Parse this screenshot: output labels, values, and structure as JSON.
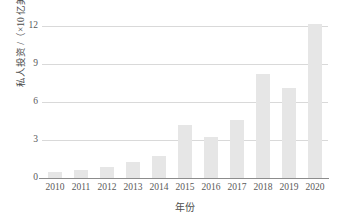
{
  "chart_data": {
    "type": "bar",
    "title": "",
    "subtitle": "",
    "xlabel": "年份",
    "ylabel": "私人投资 /（×10 亿美元）",
    "categories": [
      "2010",
      "2011",
      "2012",
      "2013",
      "2014",
      "2015",
      "2016",
      "2017",
      "2018",
      "2019",
      "2020"
    ],
    "values": [
      0.45,
      0.6,
      0.9,
      1.25,
      1.7,
      4.2,
      3.2,
      4.55,
      8.2,
      7.05,
      12.1
    ],
    "series": [
      {
        "name": "私人投资",
        "values": [
          0.45,
          0.6,
          0.9,
          1.25,
          1.7,
          4.2,
          3.2,
          4.55,
          8.2,
          7.05,
          12.1
        ]
      }
    ],
    "ylim": [
      0,
      12.6
    ],
    "xlim": [
      0,
      11
    ],
    "yticks": [
      0,
      3,
      6,
      9,
      12
    ],
    "ytick_labels": [
      "0",
      "3",
      "6",
      "9",
      "12"
    ],
    "xtick_labels": [
      "2010",
      "2011",
      "2012",
      "2013",
      "2014",
      "2015",
      "2016",
      "2017",
      "2018",
      "2019",
      "2020"
    ],
    "grid": "horizontal",
    "legend": "none",
    "bar_color": "#e6e6e6",
    "gridline_color": "#d9d9d9",
    "axis_color": "#8c8c8c",
    "text_color": "#595959",
    "background": "#ffffff",
    "annotations": []
  }
}
